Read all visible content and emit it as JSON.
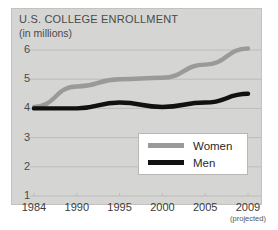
{
  "chart_data": {
    "type": "line",
    "title": "U.S. COLLEGE ENROLLMENT",
    "subtitle": "(in millions)",
    "xlabel": "",
    "ylabel": "",
    "grid": true,
    "legend_position": "inside-bottom-right",
    "ylim": [
      1,
      6.3
    ],
    "yticks": [
      6,
      5,
      4,
      3,
      2,
      1
    ],
    "ytick_labels": [
      "6",
      "5",
      "4",
      "3",
      "2",
      "1"
    ],
    "categories": [
      "1984",
      "1990",
      "1995",
      "2000",
      "2005",
      "2009"
    ],
    "xtick_labels": [
      "1984",
      "1990",
      "1995",
      "2000",
      "2005",
      "2009"
    ],
    "x_note": "(projected)",
    "x_note_for": "2009",
    "series": [
      {
        "name": "Women",
        "color": "#9a9a98",
        "values": [
          4.05,
          4.75,
          5.0,
          5.05,
          5.5,
          6.05
        ]
      },
      {
        "name": "Men",
        "color": "#111111",
        "values": [
          4.0,
          4.0,
          4.2,
          4.05,
          4.2,
          4.5
        ]
      }
    ],
    "colors": {
      "panel_background": "#d5d5d3",
      "gridline": "#bcbcba",
      "text": "#4a4a4a",
      "women_series": "#9a9a98",
      "men_series": "#111111",
      "legend_background": "#ffffff"
    }
  },
  "legend": {
    "items": [
      {
        "label": "Women",
        "swatch_name": "legend-swatch-women"
      },
      {
        "label": "Men",
        "swatch_name": "legend-swatch-men"
      }
    ]
  }
}
